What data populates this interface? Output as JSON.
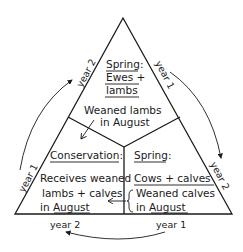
{
  "diagram": {
    "type": "rotational grazing triangle",
    "top_section": {
      "title": "Spring:",
      "line1": "Ewes +",
      "line2": "lambs",
      "transfer_line1": "Weaned lambs",
      "transfer_line2": "in August"
    },
    "left_section": {
      "title": "Conservation:",
      "line1": "Receives weaned",
      "line2": "lambs + calves",
      "line3_prefix": "in ",
      "line3_month": "August"
    },
    "right_section": {
      "title": "Spring:",
      "line1": "Cows + calves",
      "line2": "Weaned calves",
      "line3_prefix": "in ",
      "line3_month": "August"
    },
    "side_labels": {
      "left_upper": "year 2",
      "left_lower": "year 1",
      "right_upper": "year 1",
      "right_lower": "year 2",
      "bottom_left": "year 2",
      "bottom_right": "year 1"
    },
    "colors": {
      "ink": "#1a1a1a",
      "background": "#ffffff"
    }
  }
}
